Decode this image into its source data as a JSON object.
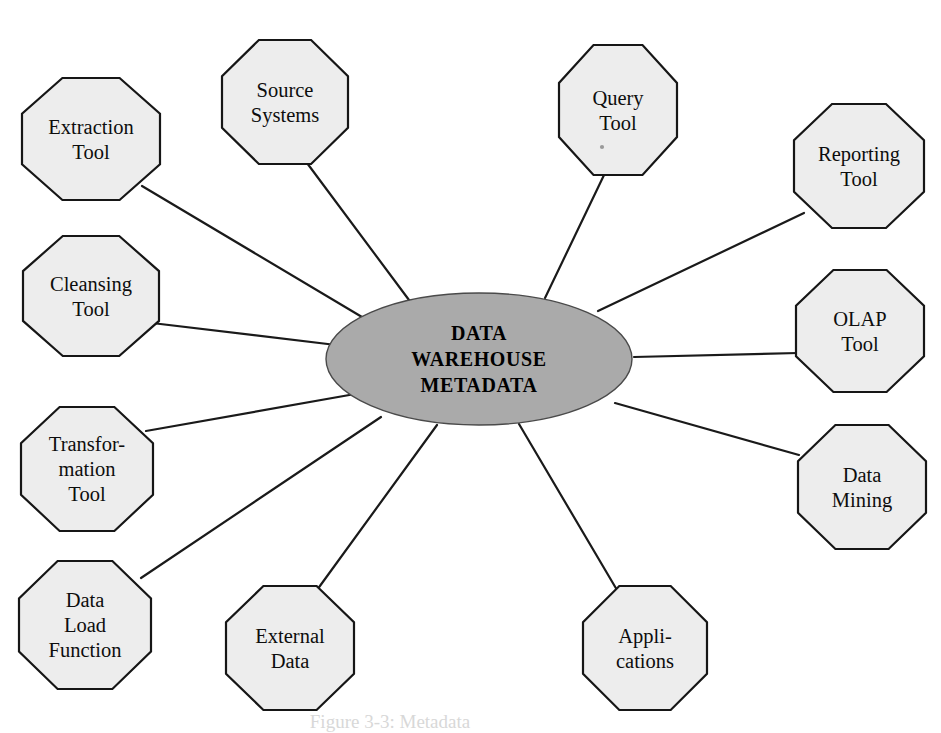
{
  "diagram": {
    "type": "hub-and-spoke",
    "background_color": "#ffffff",
    "hub": {
      "name": "data-warehouse-metadata-hub",
      "shape": "ellipse",
      "fill_color": "#aaaaaa",
      "stroke_color": "#4a4a4a",
      "center": {
        "x": 479,
        "y": 359
      },
      "radius": {
        "x": 153,
        "y": 66
      },
      "lines": [
        "DATA",
        "WAREHOUSE",
        "METADATA"
      ]
    },
    "node_style": {
      "shape": "octagon",
      "fill_color": "#ededed",
      "stroke_color": "#161616"
    },
    "nodes": [
      {
        "id": "extraction-tool",
        "lines": [
          "Extraction",
          "Tool"
        ],
        "center": {
          "x": 91,
          "y": 139
        },
        "radius": {
          "x": 69,
          "y": 61
        },
        "connector": {
          "from": {
            "x": 142,
            "y": 186
          },
          "to": {
            "x": 367,
            "y": 320
          }
        }
      },
      {
        "id": "source-systems",
        "lines": [
          "Source",
          "Systems"
        ],
        "center": {
          "x": 285,
          "y": 102
        },
        "radius": {
          "x": 63,
          "y": 62
        },
        "connector": {
          "from": {
            "x": 307,
            "y": 163
          },
          "to": {
            "x": 409,
            "y": 300
          }
        }
      },
      {
        "id": "query-tool",
        "lines": [
          "Query",
          "Tool"
        ],
        "center": {
          "x": 618,
          "y": 110
        },
        "radius": {
          "x": 59,
          "y": 65
        },
        "connector": {
          "from": {
            "x": 605,
            "y": 173
          },
          "to": {
            "x": 545,
            "y": 298
          }
        }
      },
      {
        "id": "reporting-tool",
        "lines": [
          "Reporting",
          "Tool"
        ],
        "center": {
          "x": 859,
          "y": 166
        },
        "radius": {
          "x": 65,
          "y": 62
        },
        "connector": {
          "from": {
            "x": 804,
            "y": 213
          },
          "to": {
            "x": 598,
            "y": 311
          }
        }
      },
      {
        "id": "cleansing-tool",
        "lines": [
          "Cleansing",
          "Tool"
        ],
        "center": {
          "x": 91,
          "y": 296
        },
        "radius": {
          "x": 68,
          "y": 60
        },
        "connector": {
          "from": {
            "x": 152,
            "y": 323
          },
          "to": {
            "x": 336,
            "y": 345
          }
        }
      },
      {
        "id": "olap-tool",
        "lines": [
          "OLAP",
          "Tool"
        ],
        "center": {
          "x": 860,
          "y": 331
        },
        "radius": {
          "x": 64,
          "y": 61
        },
        "connector": {
          "from": {
            "x": 798,
            "y": 353
          },
          "to": {
            "x": 634,
            "y": 357
          }
        }
      },
      {
        "id": "transformation-tool",
        "lines": [
          "Transfor-",
          "mation",
          "Tool"
        ],
        "center": {
          "x": 87,
          "y": 469
        },
        "radius": {
          "x": 66,
          "y": 62
        },
        "connector": {
          "from": {
            "x": 146,
            "y": 431
          },
          "to": {
            "x": 355,
            "y": 394
          }
        }
      },
      {
        "id": "data-mining",
        "lines": [
          "Data",
          "Mining"
        ],
        "center": {
          "x": 862,
          "y": 487
        },
        "radius": {
          "x": 64,
          "y": 62
        },
        "connector": {
          "from": {
            "x": 799,
            "y": 455
          },
          "to": {
            "x": 615,
            "y": 403
          }
        }
      },
      {
        "id": "data-load-function",
        "lines": [
          "Data",
          "Load",
          "Function"
        ],
        "center": {
          "x": 85,
          "y": 625
        },
        "radius": {
          "x": 66,
          "y": 64
        },
        "connector": {
          "from": {
            "x": 141,
            "y": 578
          },
          "to": {
            "x": 381,
            "y": 417
          }
        }
      },
      {
        "id": "external-data",
        "lines": [
          "External",
          "Data"
        ],
        "center": {
          "x": 290,
          "y": 648
        },
        "radius": {
          "x": 64,
          "y": 62
        },
        "connector": {
          "from": {
            "x": 317,
            "y": 590
          },
          "to": {
            "x": 437,
            "y": 425
          }
        }
      },
      {
        "id": "applications",
        "lines": [
          "Appli-",
          "cations"
        ],
        "center": {
          "x": 645,
          "y": 648
        },
        "radius": {
          "x": 62,
          "y": 62
        },
        "connector": {
          "from": {
            "x": 617,
            "y": 590
          },
          "to": {
            "x": 519,
            "y": 424
          }
        }
      }
    ],
    "artifact_speck": {
      "x": 602,
      "y": 147
    },
    "caption": {
      "text": "Figure 3-3:  Metadata",
      "x": 390,
      "y": 728
    }
  }
}
